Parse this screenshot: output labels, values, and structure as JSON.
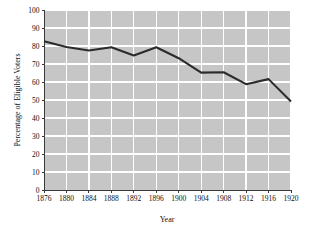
{
  "chart_data": {
    "type": "line",
    "title": "",
    "subtitle": "",
    "xlabel": "Year",
    "ylabel": "Percentage of Eligible Voters",
    "categories": [
      1876,
      1880,
      1884,
      1888,
      1892,
      1896,
      1900,
      1904,
      1908,
      1912,
      1916,
      1920
    ],
    "x_tick_labels": [
      "1876",
      "1880",
      "1884",
      "1888",
      "1892",
      "1896",
      "1900",
      "1904",
      "1908",
      "1912",
      "1916",
      "1920"
    ],
    "y_tick_labels": [
      "0",
      "10",
      "20",
      "30",
      "40",
      "50",
      "60",
      "70",
      "80",
      "90",
      "100"
    ],
    "y_ticks": [
      0,
      10,
      20,
      30,
      40,
      50,
      60,
      70,
      80,
      90,
      100
    ],
    "values": [
      82.6,
      79.4,
      77.5,
      79.3,
      74.7,
      79.3,
      73.2,
      65.2,
      65.4,
      58.8,
      61.6,
      49.2
    ],
    "series": [
      {
        "name": "Voter Turnout",
        "values": [
          82.6,
          79.4,
          77.5,
          79.3,
          74.7,
          79.3,
          73.2,
          65.2,
          65.4,
          58.8,
          61.6,
          49.2
        ]
      }
    ],
    "xlim": [
      1876,
      1920
    ],
    "ylim": [
      0,
      100
    ],
    "grid": true,
    "legend": false,
    "legend_position": "none",
    "colors": {
      "plot_background": "#c6c6c6",
      "gridline": "#ffffff",
      "line": "#2b2b2b",
      "axis": "#3a3a3a",
      "page_background": "#ffffff",
      "text": "#101010"
    }
  }
}
